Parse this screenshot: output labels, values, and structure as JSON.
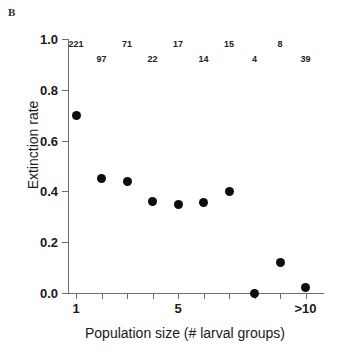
{
  "panel": {
    "label": "B"
  },
  "chart_data": {
    "type": "scatter",
    "title": "",
    "xlabel": "Population size (# larval groups)",
    "ylabel": "Extinction rate",
    "xlim": [
      0.5,
      10.5
    ],
    "ylim": [
      0.0,
      1.0
    ],
    "grid": false,
    "legend": null,
    "x": [
      1,
      2,
      3,
      4,
      5,
      6,
      7,
      8,
      9,
      10
    ],
    "y": [
      0.7,
      0.45,
      0.44,
      0.36,
      0.35,
      0.355,
      0.4,
      0.0,
      0.12,
      0.02
    ],
    "point_labels": [
      "221",
      "97",
      "71",
      "22",
      "17",
      "14",
      "15",
      "4",
      "8",
      "39"
    ],
    "point_label_rows": [
      0,
      1,
      0,
      1,
      0,
      1,
      0,
      1,
      0,
      1
    ],
    "xticks": [
      1,
      2,
      3,
      4,
      5,
      6,
      7,
      8,
      9,
      10
    ],
    "xticklabels": [
      "1",
      "",
      "",
      "",
      "5",
      "",
      "",
      "",
      "",
      ">10"
    ],
    "yticks": [
      0.0,
      0.2,
      0.4,
      0.6,
      0.8,
      1.0
    ],
    "yticklabels": [
      "0.0",
      "0.2",
      "0.4",
      "0.6",
      "0.8",
      "1.0"
    ],
    "marker_color": "#0d0d0d",
    "axis_color": "#6d6d6d"
  }
}
